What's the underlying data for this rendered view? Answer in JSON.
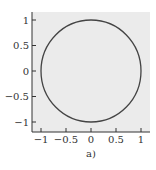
{
  "chart_data": {
    "type": "line",
    "title": "",
    "caption": "a)",
    "xlabel": "",
    "ylabel": "",
    "xlim": [
      -1.2,
      1.2
    ],
    "ylim": [
      -1.2,
      1.2
    ],
    "grid": false,
    "x_ticks": [
      -1,
      -0.5,
      0,
      0.5,
      1
    ],
    "x_tick_labels": [
      "−1",
      "−0.5",
      "0",
      "0.5",
      "1"
    ],
    "y_ticks": [
      1,
      0.5,
      0,
      -0.5,
      -1
    ],
    "y_tick_labels": [
      "1",
      "0.5",
      "0",
      "−0.5",
      "−1"
    ],
    "series": [
      {
        "name": "unit circle",
        "shape": "circle",
        "center": [
          0,
          0
        ],
        "radius": 1,
        "color": "#444444"
      }
    ],
    "background_color": "#ebebeb",
    "legend": null
  }
}
